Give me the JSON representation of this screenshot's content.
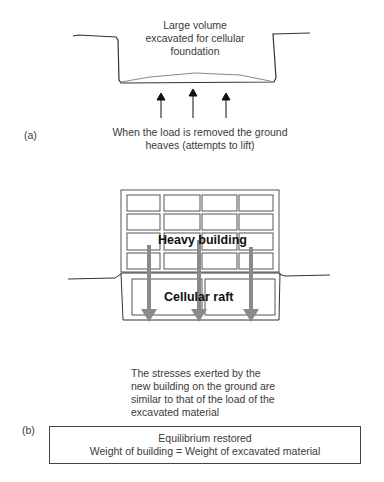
{
  "panel_a": {
    "label": "(a)",
    "excavation_text": [
      "Large volume",
      "excavated for cellular",
      "foundation"
    ],
    "caption": [
      "When the load is removed the ground",
      "heaves (attempts to lift)"
    ],
    "arrows": {
      "count": 3,
      "direction": "up",
      "color": "#111111"
    }
  },
  "panel_b": {
    "label": "(b)",
    "building_label": "Heavy building",
    "raft_label": "Cellular raft",
    "building_grid": {
      "rows": 4,
      "cols": 4
    },
    "raft_cells": 2,
    "arrows": {
      "count": 3,
      "direction": "down",
      "color": "#8a8a8a"
    },
    "caption": [
      "The stresses exerted by the",
      "new building on the ground are",
      "similar to that of the load of the",
      "excavated material"
    ],
    "equilibrium_box": {
      "title": "Equilibrium restored",
      "equation": "Weight of building = Weight of excavated material"
    }
  }
}
